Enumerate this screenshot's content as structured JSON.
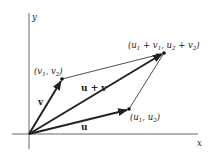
{
  "diagram": {
    "axes": {
      "x_label": "x",
      "y_label": "y",
      "origin": [
        29,
        134
      ]
    },
    "points": {
      "v": {
        "label": "(v1, v2)",
        "pos": [
          62,
          79
        ]
      },
      "u": {
        "label": "(u1, u2)",
        "pos": [
          129,
          109
        ]
      },
      "sum": {
        "label": "(u1 + v1, u2 + v2)",
        "pos": [
          164,
          53
        ]
      }
    },
    "vectors": [
      {
        "name": "v",
        "label": "v",
        "from": "origin",
        "to": "v"
      },
      {
        "name": "u",
        "label": "u",
        "from": "origin",
        "to": "u"
      },
      {
        "name": "u+v",
        "label": "u + v",
        "from": "origin",
        "to": "sum"
      }
    ],
    "labels": {
      "v_vec": "v",
      "u_vec": "u",
      "sum_vec": "u + v",
      "x_axis": "x",
      "y_axis": "y"
    },
    "colors": {
      "stroke": "#222222",
      "axis": "#555555",
      "background": "#ffffff"
    }
  }
}
